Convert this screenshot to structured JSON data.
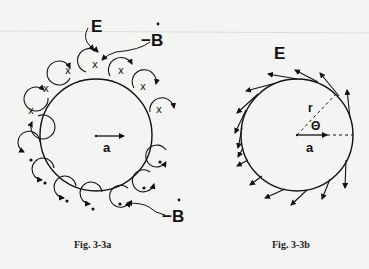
{
  "figure_a": {
    "caption": "Fig. 3-3a",
    "label_E": "E",
    "label_Bdot_top": "−B",
    "label_Bdot_bottom": "−B",
    "label_a": "a",
    "upper_symbol": "x",
    "lower_symbol": "•",
    "upper_loop_count": 7,
    "lower_loop_count": 7
  },
  "figure_b": {
    "caption": "Fig. 3-3b",
    "label_E": "E",
    "label_r": "r",
    "label_theta": "Θ",
    "label_a": "a",
    "tangent_arrow_count": 16
  },
  "colors": {
    "ink": "#111111",
    "paper": "#f4f4f2"
  }
}
